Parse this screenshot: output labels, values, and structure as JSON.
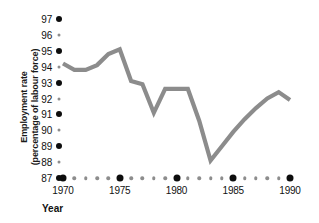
{
  "chart_data": {
    "type": "line",
    "title": "",
    "xlabel": "Year",
    "ylabel": "Employment rate (percentage of labour force)",
    "ylabel_line1": "Employment rate",
    "ylabel_line2": "(percentage of labour force)",
    "series_color": "#8c8c8c",
    "xlim": [
      1970,
      1990
    ],
    "ylim": [
      87,
      97
    ],
    "grid": false,
    "legend": null,
    "y_ticks": [
      {
        "value": 97,
        "label": "97",
        "major": true
      },
      {
        "value": 96,
        "label": "96",
        "major": false
      },
      {
        "value": 95,
        "label": "95",
        "major": true
      },
      {
        "value": 94,
        "label": "94",
        "major": false
      },
      {
        "value": 93,
        "label": "93",
        "major": true
      },
      {
        "value": 92,
        "label": "92",
        "major": false
      },
      {
        "value": 91,
        "label": "91",
        "major": true
      },
      {
        "value": 90,
        "label": "90",
        "major": false
      },
      {
        "value": 89,
        "label": "89",
        "major": true
      },
      {
        "value": 88,
        "label": "88",
        "major": false
      },
      {
        "value": 87,
        "label": "87",
        "major": true
      }
    ],
    "x_ticks": [
      {
        "value": 1970,
        "label": "1970",
        "major": true
      },
      {
        "value": 1971,
        "label": "",
        "major": false
      },
      {
        "value": 1972,
        "label": "",
        "major": false
      },
      {
        "value": 1973,
        "label": "",
        "major": false
      },
      {
        "value": 1974,
        "label": "",
        "major": false
      },
      {
        "value": 1975,
        "label": "1975",
        "major": true
      },
      {
        "value": 1976,
        "label": "",
        "major": false
      },
      {
        "value": 1977,
        "label": "",
        "major": false
      },
      {
        "value": 1978,
        "label": "",
        "major": false
      },
      {
        "value": 1979,
        "label": "",
        "major": false
      },
      {
        "value": 1980,
        "label": "1980",
        "major": true
      },
      {
        "value": 1981,
        "label": "",
        "major": false
      },
      {
        "value": 1982,
        "label": "",
        "major": false
      },
      {
        "value": 1983,
        "label": "",
        "major": false
      },
      {
        "value": 1984,
        "label": "",
        "major": false
      },
      {
        "value": 1985,
        "label": "1985",
        "major": true
      },
      {
        "value": 1986,
        "label": "",
        "major": false
      },
      {
        "value": 1987,
        "label": "",
        "major": false
      },
      {
        "value": 1988,
        "label": "",
        "major": false
      },
      {
        "value": 1989,
        "label": "",
        "major": false
      },
      {
        "value": 1990,
        "label": "1990",
        "major": true
      }
    ],
    "x": [
      1970,
      1971,
      1972,
      1973,
      1974,
      1975,
      1976,
      1977,
      1978,
      1979,
      1980,
      1981,
      1982,
      1983,
      1984,
      1985,
      1986,
      1987,
      1988,
      1989,
      1990
    ],
    "values": [
      94.2,
      93.8,
      93.8,
      94.1,
      94.8,
      95.1,
      93.1,
      92.9,
      91.1,
      92.6,
      92.6,
      92.6,
      90.6,
      88.1,
      89.0,
      89.9,
      90.7,
      91.4,
      92.0,
      92.4,
      91.9
    ],
    "series": [
      {
        "name": "Employment rate",
        "color": "#8c8c8c",
        "values": [
          94.2,
          93.8,
          93.8,
          94.1,
          94.8,
          95.1,
          93.1,
          92.9,
          91.1,
          92.6,
          92.6,
          92.6,
          90.6,
          88.1,
          89.0,
          89.9,
          90.7,
          91.4,
          92.0,
          92.4,
          91.9
        ]
      }
    ]
  }
}
